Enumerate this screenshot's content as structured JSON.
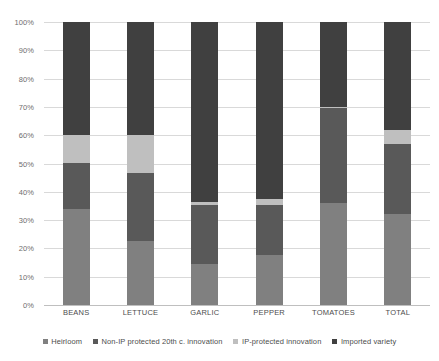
{
  "chart_data": {
    "type": "bar",
    "stacked": true,
    "normalized_percent": true,
    "title": "",
    "subtitle": "",
    "xlabel": "",
    "ylabel": "",
    "ylim": [
      0,
      100
    ],
    "grid": true,
    "legend_position": "bottom",
    "categories": [
      "BEANS",
      "LETTUCE",
      "GARLIC",
      "PEPPER",
      "TOMATOES",
      "TOTAL"
    ],
    "y_ticks": [
      "0%",
      "10%",
      "20%",
      "30%",
      "40%",
      "50%",
      "60%",
      "70%",
      "80%",
      "90%",
      "100%"
    ],
    "series": [
      {
        "name": "Heirloom",
        "color": "#808080",
        "values": [
          34,
          22.5,
          14.5,
          17.5,
          36,
          32
        ]
      },
      {
        "name": "Non-IP protected 20th c. innovation",
        "color": "#595959",
        "values": [
          16,
          24,
          21,
          18,
          33.5,
          25
        ]
      },
      {
        "name": "IP-protected innovation",
        "color": "#bfbfbf",
        "values": [
          10,
          13.5,
          1,
          2,
          0.5,
          5
        ]
      },
      {
        "name": "Imported variety",
        "color": "#404040",
        "values": [
          40,
          40,
          63.5,
          62.5,
          30,
          38
        ]
      }
    ]
  },
  "axis": {
    "gridline_color": "#d9d9d9",
    "baseline_color": "#bfbfbf",
    "tick_text_color": "#6e6e6e"
  }
}
